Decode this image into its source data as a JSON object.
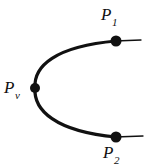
{
  "figure": {
    "type": "geometric-diagram",
    "background_color": "#ffffff",
    "stroke_color": "#111111",
    "width": 153,
    "height": 167,
    "labels": {
      "p1": {
        "base": "P",
        "subscript": "1",
        "text": "P1"
      },
      "pv": {
        "base": "P",
        "subscript": "v",
        "text": "Pv"
      },
      "p2": {
        "base": "P",
        "subscript": "2",
        "text": "P2"
      }
    },
    "points": [
      {
        "name": "P1",
        "x": 116,
        "y": 41,
        "radius": 5.5
      },
      {
        "name": "Pv",
        "x": 35,
        "y": 88,
        "radius": 5.0
      },
      {
        "name": "P2",
        "x": 116,
        "y": 137,
        "radius": 5.5
      }
    ],
    "curve": {
      "vertex": {
        "x": 35,
        "y": 88
      },
      "upper_end": {
        "x": 116,
        "y": 41
      },
      "lower_end": {
        "x": 116,
        "y": 137
      },
      "upper_path": "M 35 88 C 35 62, 60 45, 116 41",
      "lower_path": "M 35 88 C 35 114, 60 133, 116 137",
      "stroke_width_vertex": 3.4,
      "stroke_width_end": 1.6
    },
    "tangent_segments": [
      {
        "name": "p1-tangent",
        "x1": 116,
        "y1": 41,
        "x2": 141,
        "y2": 40,
        "stroke_width": 1.3
      },
      {
        "name": "p2-tangent",
        "x1": 116,
        "y1": 137,
        "x2": 143,
        "y2": 136,
        "stroke_width": 1.3
      }
    ]
  }
}
